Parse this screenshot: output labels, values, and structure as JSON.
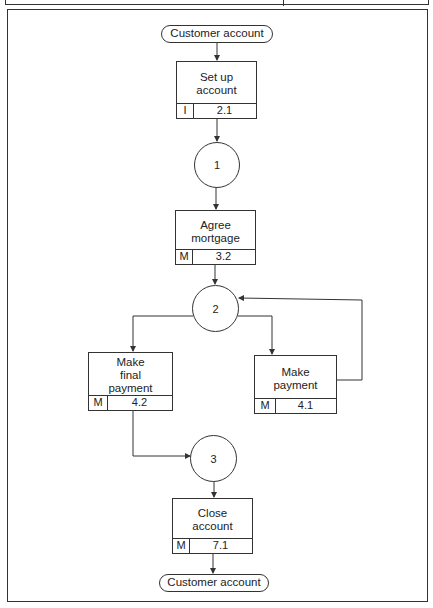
{
  "diagram": {
    "type": "entity life history (structure chart)",
    "start_node": {
      "label": "Customer account"
    },
    "end_node": {
      "label": "Customer account"
    },
    "events": [
      {
        "id": "set-up-account",
        "label": "Set up\naccount",
        "kind": "I",
        "number": "2.1"
      },
      {
        "id": "agree-mortgage",
        "label": "Agree\nmortgage",
        "kind": "M",
        "number": "3.2"
      },
      {
        "id": "make-final-payment",
        "label": "Make\nfinal\npayment",
        "kind": "M",
        "number": "4.2"
      },
      {
        "id": "make-payment",
        "label": "Make\npayment",
        "kind": "M",
        "number": "4.1"
      },
      {
        "id": "close-account",
        "label": "Close\naccount",
        "kind": "M",
        "number": "7.1"
      }
    ],
    "states": [
      {
        "id": "state-1",
        "label": "1"
      },
      {
        "id": "state-2",
        "label": "2"
      },
      {
        "id": "state-3",
        "label": "3"
      }
    ],
    "flows": [
      {
        "from": "Customer account",
        "to": "Set up account"
      },
      {
        "from": "Set up account",
        "to": "1"
      },
      {
        "from": "1",
        "to": "Agree mortgage"
      },
      {
        "from": "Agree mortgage",
        "to": "2"
      },
      {
        "from": "2",
        "to": "Make final payment"
      },
      {
        "from": "2",
        "to": "Make payment"
      },
      {
        "from": "Make payment",
        "to": "2"
      },
      {
        "from": "Make final payment",
        "to": "3"
      },
      {
        "from": "3",
        "to": "Close account"
      },
      {
        "from": "Close account",
        "to": "Customer account"
      }
    ]
  }
}
